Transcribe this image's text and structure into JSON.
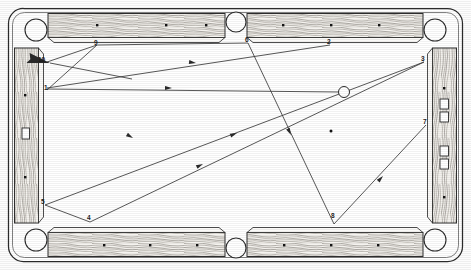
{
  "diagram": {
    "type": "pool-table-path-diagram",
    "canvas": {
      "width": 471,
      "height": 270
    },
    "colors": {
      "ink": "#1d1d1d",
      "line": "#3a3a3a",
      "rail_wood": "#f2f0ec",
      "rail_grain": "#6e6a64",
      "cloth": "#ffffff",
      "pocket": "#ffffff",
      "diamond": "#111111",
      "paper": "#fdfdfd"
    },
    "table": {
      "outer_frame": {
        "x": 8,
        "y": 8,
        "width": 455,
        "height": 254,
        "corner_radius": 14
      },
      "playfield": {
        "x": 46,
        "y": 42,
        "width": 379,
        "height": 186
      },
      "rail_label": "wood-grain-rail",
      "cushion_count": 6,
      "pockets": [
        {
          "name": "corner-pocket-top-left",
          "cx": 36,
          "cy": 30,
          "r": 11
        },
        {
          "name": "side-pocket-top",
          "cx": 236,
          "cy": 22,
          "r": 10
        },
        {
          "name": "corner-pocket-top-right",
          "cx": 435,
          "cy": 30,
          "r": 11
        },
        {
          "name": "corner-pocket-bottom-left",
          "cx": 36,
          "cy": 240,
          "r": 11
        },
        {
          "name": "side-pocket-bottom",
          "cx": 236,
          "cy": 248,
          "r": 10
        },
        {
          "name": "corner-pocket-bottom-right",
          "cx": 435,
          "cy": 240,
          "r": 11
        }
      ],
      "diamonds": {
        "top": [
          {
            "x": 97,
            "y": 25
          },
          {
            "x": 166,
            "y": 25
          },
          {
            "x": 235,
            "y": 25
          }
        ],
        "top_right": [
          {
            "x": 283,
            "y": 25
          },
          {
            "x": 330,
            "y": 25
          },
          {
            "x": 378,
            "y": 25
          }
        ],
        "bottom": [
          {
            "x": 104,
            "y": 245
          },
          {
            "x": 150,
            "y": 245
          },
          {
            "x": 197,
            "y": 245
          }
        ],
        "bottom_right": [
          {
            "x": 284,
            "y": 245
          },
          {
            "x": 331,
            "y": 245
          },
          {
            "x": 378,
            "y": 245
          }
        ],
        "left": [
          {
            "x": 26,
            "y": 95
          },
          {
            "x": 26,
            "y": 175
          }
        ],
        "right": [
          {
            "x": 444,
            "y": 88
          },
          {
            "x": 444,
            "y": 148
          }
        ]
      },
      "rail_markers": [
        {
          "name": "left-rail-sight-plate",
          "x": 22,
          "y": 128,
          "width": 8,
          "height": 12
        },
        {
          "name": "right-rail-sight-plate-upper",
          "x": 440,
          "y": 93,
          "width": 9,
          "height": 12
        },
        {
          "name": "right-rail-sight-plate-mid",
          "x": 440,
          "y": 112,
          "width": 9,
          "height": 12
        },
        {
          "name": "right-rail-sight-plate-lower",
          "x": 440,
          "y": 145,
          "width": 9,
          "height": 12
        },
        {
          "name": "right-rail-sight-plate-bottom",
          "x": 440,
          "y": 163,
          "width": 9,
          "height": 12
        }
      ]
    },
    "cue_ball": {
      "name": "cue-ball",
      "cx": 344,
      "cy": 92,
      "r": 5.5,
      "label": ""
    },
    "object_ball_spot": {
      "name": "foot-spot",
      "cx": 331,
      "cy": 131,
      "r": 1.4
    },
    "path_points": [
      {
        "id": "1",
        "x": 47,
        "y": 90,
        "label_x": 44,
        "label_y": 86,
        "desc": "cue-path-origin-left-cushion"
      },
      {
        "id": "2",
        "x": 330,
        "y": 44,
        "label_x": 327,
        "label_y": 41,
        "desc": "top-cushion-contact-right"
      },
      {
        "id": "3",
        "x": 424,
        "y": 62,
        "label_x": 421,
        "label_y": 57,
        "desc": "right-cushion-contact-upper"
      },
      {
        "id": "4",
        "x": 90,
        "y": 222,
        "label_x": 87,
        "label_y": 216,
        "desc": "bottom-cushion-contact-left"
      },
      {
        "id": "5",
        "x": 45,
        "y": 205,
        "label_x": 41,
        "label_y": 200,
        "desc": "left-cushion-contact-lower"
      },
      {
        "id": "6",
        "x": 248,
        "y": 43,
        "label_x": 245,
        "label_y": 39,
        "desc": "side-pocket-cushion-contact"
      },
      {
        "id": "7",
        "x": 426,
        "y": 125,
        "label_x": 423,
        "label_y": 120,
        "desc": "right-cushion-contact-lower"
      },
      {
        "id": "8",
        "x": 334,
        "y": 224,
        "label_x": 331,
        "label_y": 215,
        "desc": "bottom-cushion-contact-right"
      },
      {
        "id": "9",
        "x": 97,
        "y": 45,
        "label_x": 94,
        "label_y": 41,
        "desc": "top-cushion-contact-left"
      },
      {
        "id": "10",
        "x": 47,
        "y": 62,
        "label_x": 40,
        "label_y": 58,
        "desc": "aim-arrow-target"
      }
    ],
    "segments": [
      {
        "name": "segment-1-to-9",
        "from": [
          47,
          90
        ],
        "to": [
          97,
          45
        ],
        "arrow": false
      },
      {
        "name": "segment-9-to-6",
        "from": [
          97,
          45
        ],
        "to": [
          248,
          43
        ],
        "arrow": false
      },
      {
        "name": "segment-6-to-8",
        "from": [
          248,
          43
        ],
        "to": [
          334,
          224
        ],
        "arrow": true
      },
      {
        "name": "segment-8-to-7",
        "from": [
          334,
          224
        ],
        "to": [
          426,
          125
        ],
        "arrow": false
      },
      {
        "name": "segment-2-to-1",
        "from": [
          330,
          44
        ],
        "to": [
          47,
          88
        ],
        "arrow": true
      },
      {
        "name": "segment-3-to-5",
        "from": [
          424,
          62
        ],
        "to": [
          45,
          205
        ],
        "arrow": true
      },
      {
        "name": "segment-5-to-4",
        "from": [
          45,
          205
        ],
        "to": [
          90,
          222
        ],
        "arrow": false
      },
      {
        "name": "segment-4-to-3",
        "from": [
          90,
          222
        ],
        "to": [
          424,
          62
        ],
        "arrow": true
      },
      {
        "name": "segment-cue-to-1",
        "from": [
          344,
          92
        ],
        "to": [
          47,
          89
        ],
        "arrow": true
      },
      {
        "name": "segment-aim-arrow",
        "from": [
          130,
          78
        ],
        "to": [
          47,
          63
        ],
        "arrow": true
      }
    ],
    "arrow_markers": [
      {
        "name": "arrow-on-segment-2-to-1",
        "x": 196,
        "y": 63,
        "angle": 188
      },
      {
        "name": "arrow-on-segment-cue-line",
        "x": 165,
        "y": 88,
        "angle": 181
      },
      {
        "name": "arrow-on-segment-3-to-5",
        "x": 237,
        "y": 133,
        "angle": 159
      },
      {
        "name": "arrow-on-segment-6-to-8",
        "x": 291,
        "y": 135,
        "angle": 64
      },
      {
        "name": "arrow-on-segment-4-to-3",
        "x": 203,
        "y": 164,
        "angle": 334
      },
      {
        "name": "arrow-on-segment-8-to-7",
        "x": 383,
        "y": 176,
        "angle": 313
      },
      {
        "name": "arrow-on-segment-1-to-9",
        "x": 133,
        "y": 138,
        "angle": 210
      },
      {
        "name": "arrow-head-aim",
        "x": 52,
        "y": 64,
        "angle": 190
      }
    ]
  }
}
